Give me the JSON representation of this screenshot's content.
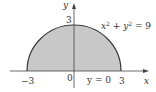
{
  "diagram": {
    "type": "region",
    "curve_equation": "x² + y² = 9",
    "curve_equation_parts": {
      "x": "x",
      "x_exp": "2",
      "plus": " + ",
      "y": "y",
      "y_exp": "2",
      "eq": " = 9"
    },
    "line_equation": "y = 0",
    "axes": {
      "x_label": "x",
      "y_label": "y"
    },
    "ticks": {
      "x_neg": "−3",
      "origin": "0",
      "x_pos": "3",
      "y_pos": "3"
    },
    "region": {
      "radius": 3,
      "x_range": [
        -3,
        3
      ],
      "y_range": [
        0,
        3
      ]
    },
    "colors": {
      "fill": "#c8c8c8",
      "stroke": "#3a3a3a",
      "axis": "#444444",
      "text": "#333333"
    }
  }
}
